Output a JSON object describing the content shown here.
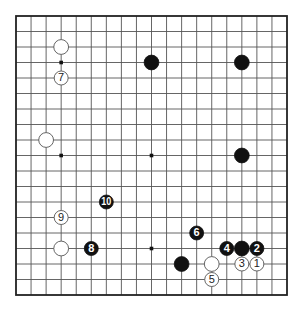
{
  "diagram": {
    "type": "go-board",
    "size": 19,
    "colors": {
      "black_stone": "#111111",
      "white_stone": "#ffffff",
      "grid": "#555555",
      "border": "#222222",
      "background": "#ffffff"
    },
    "hoshi": [
      [
        3,
        3
      ],
      [
        9,
        3
      ],
      [
        15,
        3
      ],
      [
        3,
        9
      ],
      [
        9,
        9
      ],
      [
        15,
        9
      ],
      [
        3,
        15
      ],
      [
        9,
        15
      ],
      [
        15,
        15
      ]
    ],
    "stones": [
      {
        "color": "black",
        "col": 9,
        "row": 3,
        "label": ""
      },
      {
        "color": "black",
        "col": 15,
        "row": 3,
        "label": ""
      },
      {
        "color": "black",
        "col": 15,
        "row": 9,
        "label": ""
      },
      {
        "color": "white",
        "col": 3,
        "row": 2,
        "label": ""
      },
      {
        "color": "white",
        "col": 2,
        "row": 8,
        "label": ""
      },
      {
        "color": "white",
        "col": 3,
        "row": 15,
        "label": ""
      },
      {
        "color": "black",
        "col": 11,
        "row": 16,
        "label": ""
      },
      {
        "color": "white",
        "col": 13,
        "row": 16,
        "label": ""
      },
      {
        "color": "black",
        "col": 15,
        "row": 15,
        "label": ""
      },
      {
        "color": "white",
        "col": 16,
        "row": 16,
        "label": "1"
      },
      {
        "color": "black",
        "col": 16,
        "row": 15,
        "label": "2"
      },
      {
        "color": "white",
        "col": 15,
        "row": 16,
        "label": "3"
      },
      {
        "color": "black",
        "col": 14,
        "row": 15,
        "label": "4"
      },
      {
        "color": "white",
        "col": 13,
        "row": 17,
        "label": "5"
      },
      {
        "color": "black",
        "col": 12,
        "row": 14,
        "label": "6"
      },
      {
        "color": "white",
        "col": 3,
        "row": 4,
        "label": "7"
      },
      {
        "color": "black",
        "col": 5,
        "row": 15,
        "label": "8"
      },
      {
        "color": "white",
        "col": 3,
        "row": 13,
        "label": "9"
      },
      {
        "color": "black",
        "col": 6,
        "row": 12,
        "label": "10"
      }
    ]
  }
}
